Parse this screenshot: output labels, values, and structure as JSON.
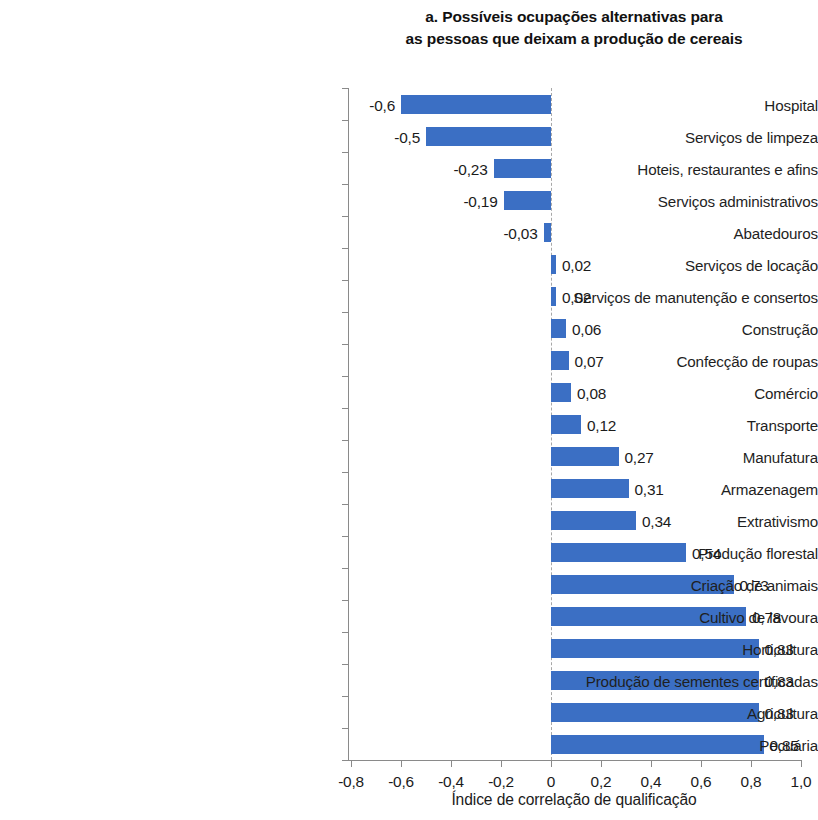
{
  "chart_data": {
    "type": "bar",
    "orientation": "horizontal",
    "title": "a. Possíveis ocupações alternativas para as pessoas que deixam a produção de cereais",
    "title_lines": [
      "a. Possíveis ocupações alternativas para",
      "as pessoas que deixam a produção de cereais"
    ],
    "xlabel": "Índice de correlação de qualificação",
    "ylabel": "",
    "xlim": [
      -0.9,
      1.05
    ],
    "xticks": [
      -0.8,
      -0.6,
      -0.4,
      -0.2,
      0,
      0.2,
      0.4,
      0.6,
      0.8,
      1.0
    ],
    "xtick_labels": [
      "-0,8",
      "-0,6",
      "-0,4",
      "-0,2",
      "0",
      "0,2",
      "0,4",
      "0,6",
      "0,8",
      "1,0"
    ],
    "grid": false,
    "legend": "none",
    "zero_line": true,
    "bar_color": "#3b6fc4",
    "axis_color": "#8a8a8a",
    "categories": [
      "Hospital",
      "Serviços de limpeza",
      "Hoteis, restaurantes e afins",
      "Serviços administrativos",
      "Abatedouros",
      "Serviços de locação",
      "Serviços de manutenção e consertos",
      "Construção",
      "Confecção de roupas",
      "Comércio",
      "Transporte",
      "Manufatura",
      "Armazenagem",
      "Extrativismo",
      "Produção florestal",
      "Criação de animais",
      "Cultivo de lavoura",
      "Horticultura",
      "Produção de sementes certificadas",
      "Agricultura",
      "Pecuária"
    ],
    "values": [
      -0.6,
      -0.5,
      -0.23,
      -0.19,
      -0.03,
      0.02,
      0.02,
      0.06,
      0.07,
      0.08,
      0.12,
      0.27,
      0.31,
      0.34,
      0.54,
      0.73,
      0.78,
      0.83,
      0.83,
      0.83,
      0.85
    ],
    "value_labels": [
      "-0,6",
      "-0,5",
      "-0,23",
      "-0,19",
      "-0,03",
      "0,02",
      "0,02",
      "0,06",
      "0,07",
      "0,08",
      "0,12",
      "0,27",
      "0,31",
      "0,34",
      "0,54",
      "0,73",
      "0,78",
      "0,83",
      "0,83",
      "0,83",
      "0,85"
    ]
  }
}
